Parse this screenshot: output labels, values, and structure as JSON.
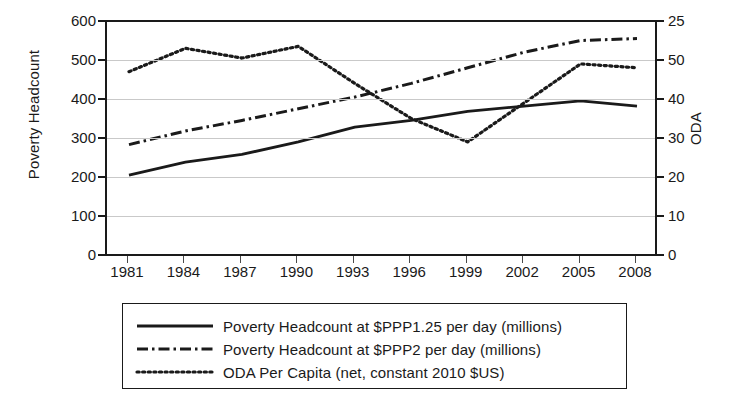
{
  "chart_data": {
    "type": "line",
    "title": "",
    "xlabel": "",
    "ylabel": "Poverty Headcount",
    "y2label": "ODA",
    "grid": true,
    "legend_position": "bottom",
    "x": [
      1981,
      1984,
      1987,
      1990,
      1993,
      1996,
      1999,
      2002,
      2005,
      2008
    ],
    "xtick_labels": [
      "1981",
      "1984",
      "1987",
      "1990",
      "1993",
      "1996",
      "1999",
      "2002",
      "2005",
      "2008"
    ],
    "ylim": [
      0,
      600
    ],
    "ytick_labels": [
      "600",
      "500",
      "400",
      "300",
      "200",
      "100",
      "0"
    ],
    "ytick_values": [
      600,
      500,
      400,
      300,
      200,
      100,
      0
    ],
    "y2lim": [
      0,
      60
    ],
    "y2tick_labels": [
      "25",
      "50",
      "40",
      "30",
      "20",
      "10",
      "0"
    ],
    "y2tick_values": [
      60,
      50,
      40,
      30,
      20,
      10,
      0
    ],
    "series": [
      {
        "name": "Poverty Headcount at $PPP1.25 per day (millions)",
        "axis": "left",
        "style": "solid",
        "values": [
          205,
          238,
          258,
          290,
          328,
          345,
          368,
          382,
          395,
          382
        ]
      },
      {
        "name": "Poverty Headcount at $PPP2 per day (millions)",
        "axis": "left",
        "style": "dash-dot",
        "values": [
          283,
          318,
          345,
          375,
          405,
          440,
          480,
          520,
          550,
          555
        ]
      },
      {
        "name": "ODA Per Capita (net, constant 2010 $US)",
        "axis": "right",
        "style": "dotted",
        "values": [
          47,
          53,
          50.5,
          53.5,
          44,
          35,
          29,
          39,
          49,
          48
        ]
      }
    ]
  },
  "axes": {
    "left_title": "Poverty Headcount",
    "right_title": "ODA"
  },
  "legend": {
    "items": [
      {
        "label": "Poverty Headcount at $PPP1.25 per day (millions)",
        "style": "solid"
      },
      {
        "label": "Poverty Headcount at $PPP2 per day (millions)",
        "style": "dash-dot"
      },
      {
        "label": "ODA Per Capita (net, constant 2010 $US)",
        "style": "dotted"
      }
    ]
  },
  "colors": {
    "line": "#1a1a1a",
    "grid": "#c9c9c9",
    "axis": "#1a1a1a",
    "background": "#ffffff"
  }
}
